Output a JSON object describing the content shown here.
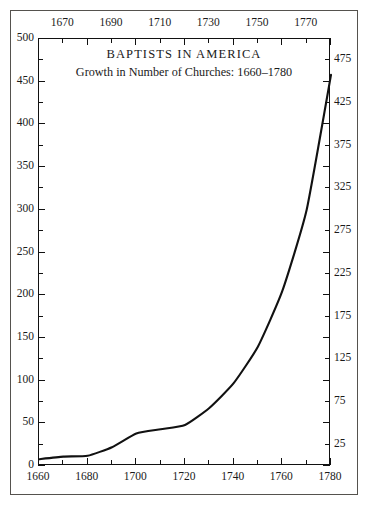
{
  "chart_data": {
    "type": "line",
    "title": "BAPTISTS IN AMERICA",
    "subtitle": "Growth in Number of Churches: 1660–1780",
    "xlabel": "",
    "ylabel": "",
    "grid": false,
    "legend": "none",
    "xlim": [
      1660,
      1780
    ],
    "ylim": [
      0,
      500
    ],
    "x_major_step": 20,
    "x_minor_step": 10,
    "y_major_step": 50,
    "y_minor_step": 25,
    "x_ticks_bottom": [
      "1660",
      "1680",
      "1700",
      "1720",
      "1740",
      "1760",
      "1780"
    ],
    "x_ticks_top": [
      "1670",
      "1690",
      "1710",
      "1730",
      "1750",
      "1770"
    ],
    "y_ticks_left": [
      "0",
      "50",
      "100",
      "150",
      "200",
      "250",
      "300",
      "350",
      "400",
      "450",
      "500"
    ],
    "y_ticks_right": [
      "25",
      "75",
      "125",
      "175",
      "225",
      "275",
      "325",
      "375",
      "425",
      "475"
    ],
    "x": [
      1660,
      1670,
      1680,
      1690,
      1700,
      1710,
      1720,
      1730,
      1740,
      1750,
      1760,
      1770,
      1780
    ],
    "values": [
      8,
      11,
      12,
      22,
      38,
      43,
      48,
      68,
      97,
      140,
      205,
      300,
      458
    ],
    "series": [
      {
        "name": "Number of Churches",
        "values": [
          8,
          11,
          12,
          22,
          38,
          43,
          48,
          68,
          97,
          140,
          205,
          300,
          458
        ]
      }
    ],
    "line_color": "#111111",
    "line_width": 2.1
  }
}
